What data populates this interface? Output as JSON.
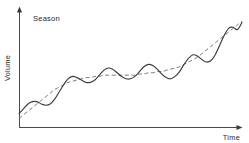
{
  "chart_data": {
    "type": "line",
    "title": "",
    "subtitle": "",
    "xlabel": "Time",
    "ylabel": "Volume",
    "grid": false,
    "legend_position": "none",
    "annotations": [
      {
        "text": "Season",
        "x_px": 33,
        "y_px": 21
      }
    ],
    "axis": {
      "x_range_px": [
        19,
        242
      ],
      "y_range_px": [
        128,
        8
      ],
      "x_tick_labels": [],
      "y_tick_labels": [],
      "x_arrow": true,
      "y_arrow": true
    },
    "x": [
      0,
      2,
      4,
      6,
      8,
      10,
      12,
      14,
      16,
      18,
      20,
      22,
      24,
      26,
      28,
      30,
      32,
      34,
      36,
      38,
      40,
      42,
      44,
      46,
      48,
      50,
      52,
      54,
      56,
      58,
      60,
      62,
      64,
      66,
      68,
      70,
      72,
      74,
      76,
      78,
      80,
      82,
      84,
      86,
      88,
      90,
      92,
      94,
      96,
      98,
      100
    ],
    "series": [
      {
        "name": "Observed (seasonal)",
        "style": "solid",
        "color": "#3c3c3c",
        "values": [
          12,
          16,
          20,
          22,
          22,
          20,
          19,
          20,
          24,
          30,
          36,
          41,
          43,
          42,
          40,
          38,
          38,
          40,
          44,
          48,
          50,
          49,
          46,
          43,
          41,
          41,
          43,
          47,
          51,
          53,
          52,
          49,
          45,
          42,
          41,
          43,
          47,
          53,
          58,
          61,
          60,
          57,
          55,
          56,
          61,
          69,
          77,
          83,
          84,
          82,
          88
        ]
      },
      {
        "name": "Trend",
        "style": "dashed",
        "color": "#6b6b6b",
        "values": [
          8,
          11,
          14,
          17,
          20,
          23,
          26,
          29,
          32,
          34,
          36,
          38,
          39,
          40,
          41,
          42,
          42,
          43,
          43,
          44,
          44,
          44,
          44,
          44,
          44,
          44,
          44,
          45,
          45,
          46,
          46,
          47,
          47,
          48,
          49,
          50,
          51,
          53,
          55,
          57,
          59,
          62,
          65,
          68,
          71,
          74,
          77,
          80,
          83,
          86,
          89
        ]
      }
    ],
    "ylim": [
      0,
      100
    ],
    "xlim": [
      0,
      100
    ],
    "cycles": 5
  }
}
